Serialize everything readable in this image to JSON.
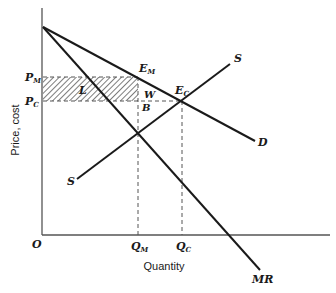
{
  "diagram": {
    "type": "economics-monopoly-vs-competition",
    "axes": {
      "y_label": "Price, cost",
      "x_label": "Quantity",
      "origin_label": "O"
    },
    "price_labels": {
      "pm": {
        "main": "P",
        "sub": "M"
      },
      "pc": {
        "main": "P",
        "sub": "C"
      }
    },
    "quantity_labels": {
      "qm": {
        "main": "Q",
        "sub": "M"
      },
      "qc": {
        "main": "Q",
        "sub": "C"
      }
    },
    "curves": {
      "demand": "D",
      "marginal_revenue": "MR",
      "supply_upper": "S",
      "supply_lower": "S"
    },
    "points": {
      "em": {
        "main": "E",
        "sub": "M"
      },
      "ec": {
        "main": "E",
        "sub": "C"
      },
      "b": "B"
    },
    "areas": {
      "loss": "L",
      "welfare": "W"
    },
    "colors": {
      "line": "#1a1a1a",
      "axis": "#555555",
      "hatch": "#444444"
    }
  }
}
